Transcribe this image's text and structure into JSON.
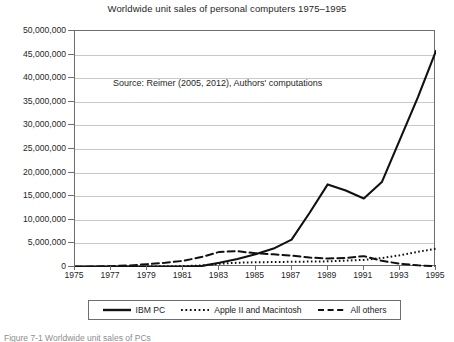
{
  "chart_data": {
    "type": "line",
    "title": "Worldwide unit sales of personal computers 1975–1995",
    "xlabel": "",
    "ylabel": "",
    "annotation": "Source: Reimer (2005, 2012), Authors' computations",
    "grid": true,
    "legend_position": "bottom",
    "xlim": [
      1975,
      1995
    ],
    "ylim": [
      0,
      50000000
    ],
    "x": [
      1975,
      1976,
      1977,
      1978,
      1979,
      1980,
      1981,
      1982,
      1983,
      1984,
      1985,
      1986,
      1987,
      1988,
      1989,
      1990,
      1991,
      1992,
      1993,
      1994,
      1995
    ],
    "xtick_labels": [
      "1975",
      "1977",
      "1979",
      "1981",
      "1983",
      "1985",
      "1987",
      "1989",
      "1991",
      "1993",
      "1995"
    ],
    "xticks": [
      1975,
      1977,
      1979,
      1981,
      1983,
      1985,
      1987,
      1989,
      1991,
      1993,
      1995
    ],
    "yticks": [
      0,
      5000000,
      10000000,
      15000000,
      20000000,
      25000000,
      30000000,
      35000000,
      40000000,
      45000000,
      50000000
    ],
    "ytick_labels": [
      "0",
      "5,000,000",
      "10,000,000",
      "15,000,000",
      "20,000,000",
      "25,000,000",
      "30,000,000",
      "35,000,000",
      "40,000,000",
      "45,000,000",
      "50,000,000"
    ],
    "series": [
      {
        "name": "IBM PC",
        "style": "solid",
        "color": "#111111",
        "values": [
          0,
          0,
          0,
          0,
          0,
          0,
          0,
          200000,
          900000,
          1700000,
          2700000,
          3900000,
          5800000,
          11500000,
          17500000,
          16200000,
          14500000,
          18000000,
          27000000,
          36000000,
          45800000
        ]
      },
      {
        "name": "Apple II and Macintosh",
        "style": "dotted",
        "color": "#111111",
        "values": [
          0,
          0,
          10000,
          40000,
          100000,
          150000,
          200000,
          320000,
          700000,
          900000,
          1000000,
          1050000,
          1100000,
          1150000,
          1200000,
          1350000,
          1500000,
          1900000,
          2500000,
          3200000,
          3900000
        ]
      },
      {
        "name": "All others",
        "style": "dashed",
        "color": "#111111",
        "values": [
          60000,
          90000,
          180000,
          330000,
          600000,
          900000,
          1300000,
          2100000,
          3200000,
          3350000,
          2900000,
          2700000,
          2400000,
          2000000,
          1800000,
          1900000,
          2300000,
          1300000,
          700000,
          350000,
          150000
        ]
      }
    ]
  },
  "legend": {
    "items": [
      {
        "label": "IBM PC",
        "style": "solid"
      },
      {
        "label": "Apple II and Macintosh",
        "style": "dotted"
      },
      {
        "label": "All others",
        "style": "dashed"
      }
    ]
  },
  "figure_caption": "Figure 7-1 Worldwide unit sales of PCs"
}
